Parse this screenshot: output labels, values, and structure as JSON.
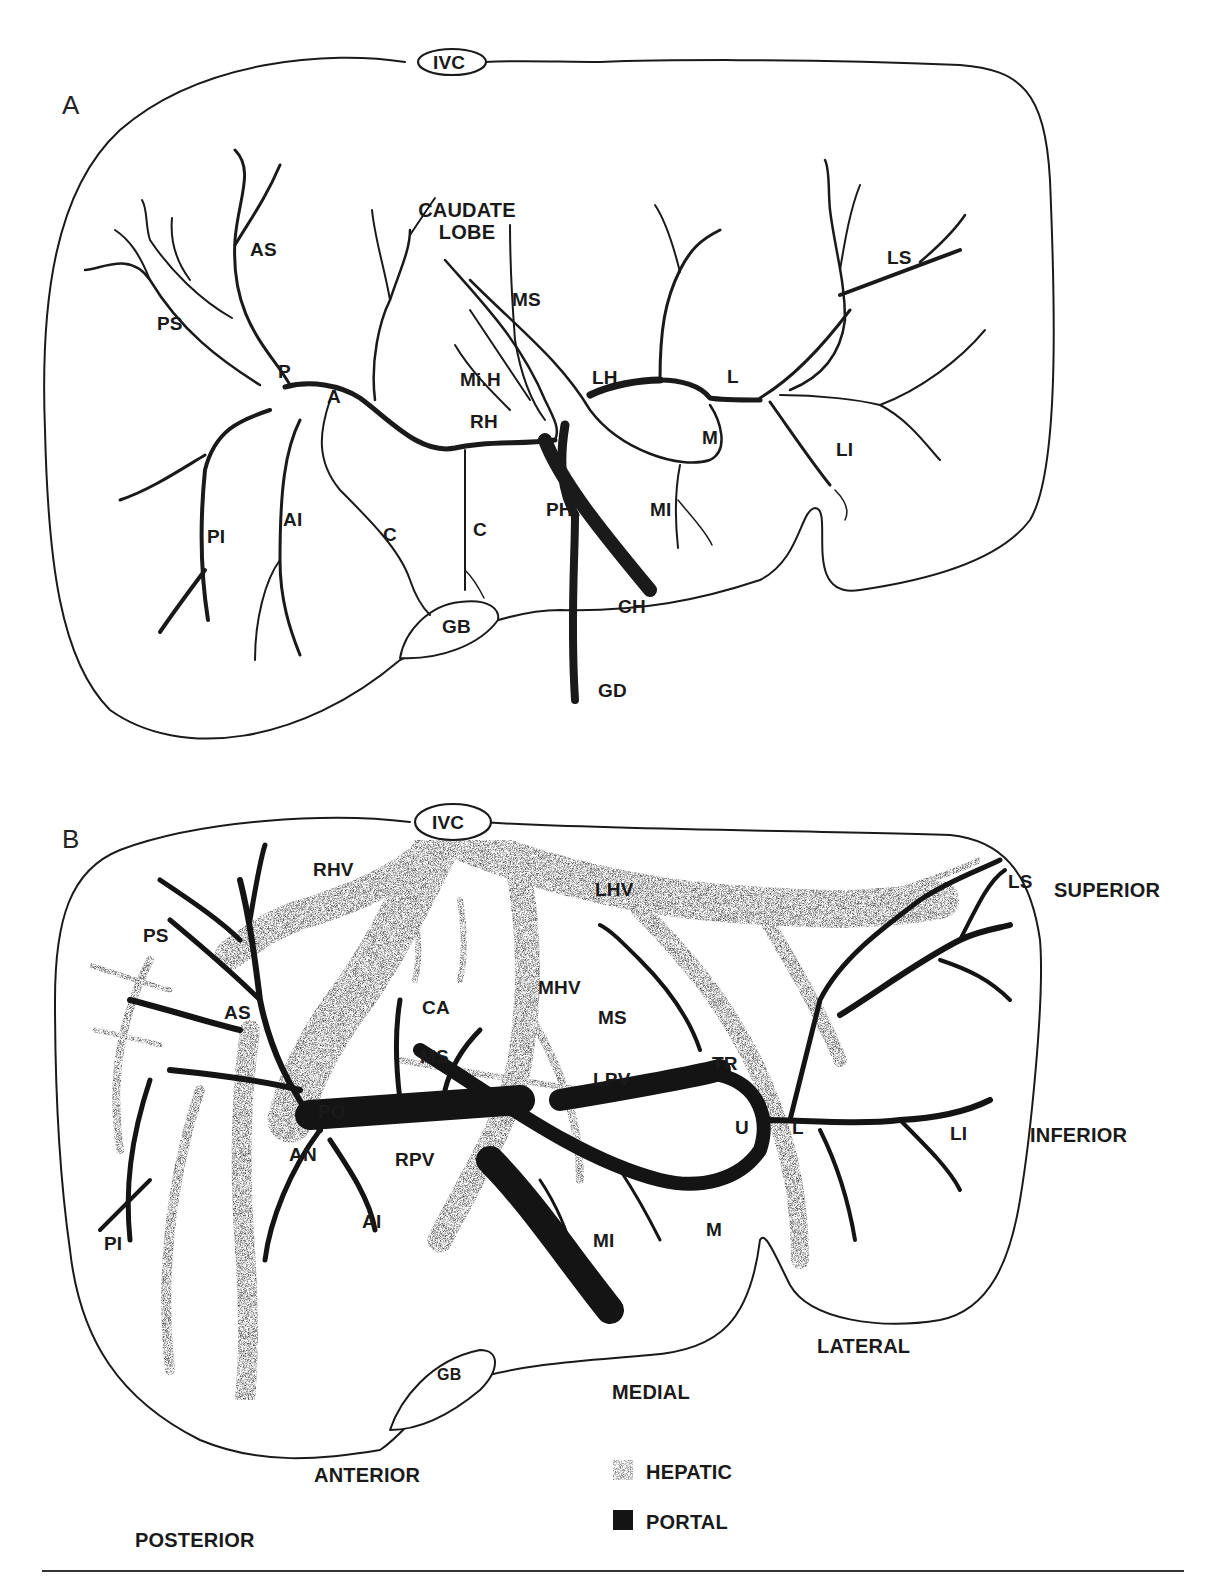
{
  "figure": {
    "panel_a": {
      "label": "A",
      "labels": {
        "ivc": "IVC",
        "caudate_line1": "CAUDATE",
        "caudate_line2": "LOBE",
        "as": "AS",
        "ps": "PS",
        "p": "P",
        "a": "A",
        "ms": "MS",
        "mih": "Mi.H",
        "rh": "RH",
        "lh": "LH",
        "l": "L",
        "ls": "LS",
        "m": "M",
        "li": "LI",
        "pi": "PI",
        "ai": "AI",
        "c1": "C",
        "c2": "C",
        "ph": "PH",
        "mi": "MI",
        "ch": "CH",
        "gb": "GB",
        "gd": "GD"
      }
    },
    "panel_b": {
      "label": "B",
      "labels": {
        "ivc": "IVC",
        "rhv": "RHV",
        "lhv": "LHV",
        "ls": "LS",
        "ps": "PS",
        "as": "AS",
        "ca": "CA",
        "mhv": "MHV",
        "ms1": "MS",
        "ms2": "MS",
        "po": "PO",
        "lpv": "LPV",
        "tr": "TR",
        "u": "U",
        "l": "L",
        "li": "LI",
        "an": "AN",
        "rpv": "RPV",
        "pi": "PI",
        "ai": "AI",
        "mi": "MI",
        "m": "M",
        "gb": "GB"
      },
      "orientation": {
        "superior": "SUPERIOR",
        "inferior": "INFERIOR",
        "lateral": "LATERAL",
        "medial": "MEDIAL",
        "anterior": "ANTERIOR",
        "posterior": "POSTERIOR"
      }
    },
    "legend": {
      "items": [
        {
          "label": "HEPATIC",
          "swatch": "stippled",
          "color": "#8a8a8a"
        },
        {
          "label": "PORTAL",
          "swatch": "solid",
          "color": "#1a1a1a"
        }
      ]
    }
  }
}
